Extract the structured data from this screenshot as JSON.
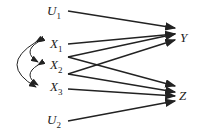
{
  "nodes": {
    "u1": {
      "name": "U",
      "sub": "1"
    },
    "x1": {
      "name": "X",
      "sub": "1"
    },
    "x2": {
      "name": "X",
      "sub": "2"
    },
    "x3": {
      "name": "X",
      "sub": "3"
    },
    "u2": {
      "name": "U",
      "sub": "2"
    },
    "y": {
      "name": "Y"
    },
    "z": {
      "name": "Z"
    }
  },
  "edges": [
    "U1->Y",
    "X1->Y",
    "X1->Z",
    "X2->Y",
    "X2->Z",
    "X3->Y",
    "X3->Z",
    "U2->Z"
  ],
  "correlations": [
    "X1<->X2",
    "X2<->X3",
    "X1<->X3"
  ],
  "colors": {
    "line": "#222222"
  }
}
